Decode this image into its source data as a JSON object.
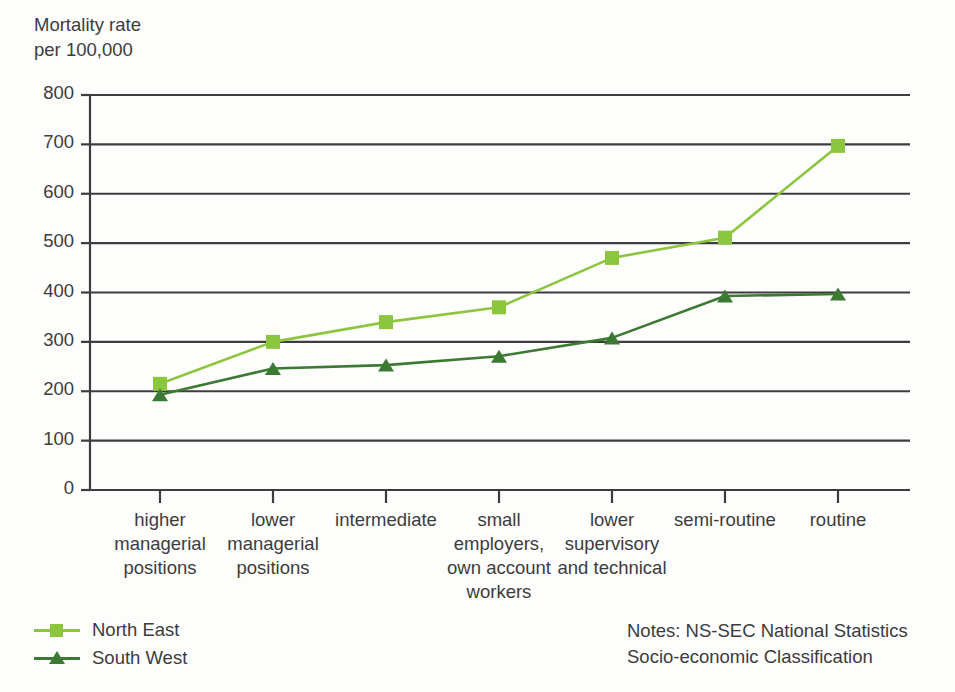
{
  "chart_data": {
    "type": "line",
    "title": "",
    "ylabel": "Mortality rate\nper 100,000",
    "xlabel": "",
    "ylim": [
      0,
      800
    ],
    "yticks": [
      0,
      100,
      200,
      300,
      400,
      500,
      600,
      700,
      800
    ],
    "ytick_labels": [
      "0",
      "100",
      "200",
      "300",
      "400",
      "500",
      "600",
      "700",
      "800"
    ],
    "grid": true,
    "legend_position": "bottom-left",
    "categories": [
      "higher\nmanagerial\npositions",
      "lower\nmanagerial\npositions",
      "intermediate",
      "small\nemployers,\nown account\nworkers",
      "lower\nsupervisory\nand technical",
      "semi-routine",
      "routine"
    ],
    "series": [
      {
        "name": "North East",
        "marker": "square",
        "color": "#8CC63F",
        "values": [
          215,
          300,
          340,
          370,
          470,
          511,
          697
        ]
      },
      {
        "name": "South West",
        "marker": "triangle",
        "color": "#3C7A33",
        "values": [
          193,
          246,
          253,
          271,
          308,
          393,
          397
        ]
      }
    ],
    "annotations": {
      "notes": "Notes: NS-SEC National Statistics\nSocio-economic Classification"
    }
  },
  "colors": {
    "north_east": "#8CC63F",
    "south_west": "#3C7A33",
    "axis": "#3d3d3d",
    "text": "#3c3c3c"
  }
}
